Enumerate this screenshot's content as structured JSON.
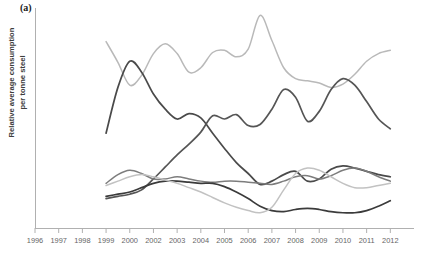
{
  "panel": {
    "label": "(a)"
  },
  "axes": {
    "ylabel_line1": "Relative average consumption",
    "ylabel_line2": "per tonne steel",
    "ylabel": "Relative average consumption\nper tonne steel",
    "xlabel": "",
    "axis_color": "#b0b0b0",
    "tick_label_color": "#666666"
  },
  "chart_data": {
    "type": "line",
    "title": "",
    "subtitle": "",
    "xlabel": "",
    "ylabel": "Relative average consumption per tonne steel",
    "xlim": [
      1996,
      2012
    ],
    "ylim": [
      0,
      1
    ],
    "grid": false,
    "legend": "none",
    "y_axis_ticks_shown": false,
    "xtick_labels": [
      "1996",
      "1997",
      "1998",
      "1999",
      "2000",
      "2002",
      "2003",
      "2004",
      "2005",
      "2006",
      "2007",
      "2008",
      "2009",
      "2010",
      "2011",
      "2012"
    ],
    "xtick_values": [
      1996,
      1997,
      1998,
      1999,
      2000,
      2001,
      2002,
      2003,
      2004,
      2005,
      2006,
      2007,
      2008,
      2009,
      2010,
      2011
    ],
    "x": [
      1999,
      1999.5,
      2000,
      2000.5,
      2001,
      2001.5,
      2002,
      2002.5,
      2003,
      2003.5,
      2004,
      2004.5,
      2005,
      2005.5,
      2006,
      2006.5,
      2007,
      2007.5,
      2008,
      2008.5,
      2009,
      2009.5,
      2010,
      2010.5,
      2011
    ],
    "series": [
      {
        "name": "series-1",
        "color": "#b9b9b9",
        "width": 1.5,
        "values": [
          0.855,
          0.76,
          0.655,
          0.7,
          0.8,
          0.845,
          0.8,
          0.715,
          0.735,
          0.805,
          0.815,
          0.785,
          0.82,
          0.975,
          0.86,
          0.735,
          0.685,
          0.675,
          0.665,
          0.645,
          0.66,
          0.705,
          0.765,
          0.8,
          0.815
        ]
      },
      {
        "name": "series-2",
        "color": "#4a4a4a",
        "width": 1.7,
        "values": [
          0.435,
          0.645,
          0.765,
          0.715,
          0.615,
          0.545,
          0.5,
          0.525,
          0.505,
          0.435,
          0.365,
          0.3,
          0.25,
          0.2,
          0.215,
          0.245,
          0.26,
          0.215,
          0.225,
          0.27,
          0.285,
          0.275,
          0.26,
          0.245,
          0.235
        ]
      },
      {
        "name": "series-3",
        "color": "#555555",
        "width": 1.7,
        "values": [
          0.135,
          0.145,
          0.155,
          0.175,
          0.225,
          0.28,
          0.335,
          0.385,
          0.44,
          0.515,
          0.5,
          0.52,
          0.47,
          0.475,
          0.545,
          0.635,
          0.6,
          0.49,
          0.535,
          0.635,
          0.685,
          0.655,
          0.58,
          0.5,
          0.455
        ]
      },
      {
        "name": "series-4",
        "color": "#7d7d7d",
        "width": 1.5,
        "values": [
          0.205,
          0.245,
          0.265,
          0.25,
          0.225,
          0.225,
          0.235,
          0.225,
          0.215,
          0.21,
          0.215,
          0.215,
          0.21,
          0.205,
          0.2,
          0.215,
          0.235,
          0.24,
          0.225,
          0.24,
          0.265,
          0.275,
          0.26,
          0.235,
          0.215
        ]
      },
      {
        "name": "series-5",
        "color": "#3b3b3b",
        "width": 1.7,
        "values": [
          0.145,
          0.155,
          0.165,
          0.185,
          0.205,
          0.215,
          0.215,
          0.21,
          0.205,
          0.205,
          0.19,
          0.165,
          0.135,
          0.1,
          0.08,
          0.075,
          0.085,
          0.09,
          0.085,
          0.075,
          0.07,
          0.07,
          0.08,
          0.1,
          0.125
        ]
      },
      {
        "name": "series-6",
        "color": "#c2c2c2",
        "width": 1.5,
        "values": [
          0.195,
          0.215,
          0.235,
          0.245,
          0.235,
          0.22,
          0.205,
          0.185,
          0.165,
          0.14,
          0.115,
          0.095,
          0.08,
          0.07,
          0.095,
          0.175,
          0.25,
          0.275,
          0.265,
          0.235,
          0.205,
          0.185,
          0.185,
          0.195,
          0.205
        ]
      }
    ]
  }
}
